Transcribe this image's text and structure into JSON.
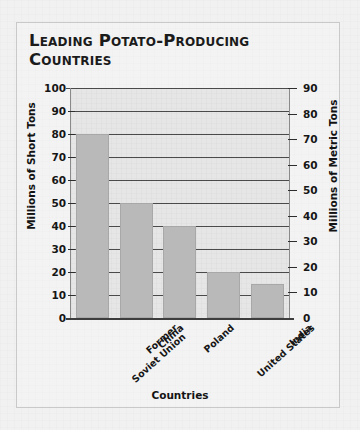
{
  "chart_data": {
    "type": "bar",
    "title": "Leading Potato-Producing\nCountries",
    "categories": [
      "Former\nSoviet Union",
      "China",
      "Poland",
      "United States",
      "India"
    ],
    "values": [
      80,
      50,
      40,
      20,
      15
    ],
    "xlabel": "Countries",
    "ylabel": "Millions of Short Tons",
    "ylabel_secondary": "Millions of Metric Tons",
    "ylim": [
      0,
      100
    ],
    "ylim_secondary": [
      0,
      90
    ],
    "yticks": [
      0,
      10,
      20,
      30,
      40,
      50,
      60,
      70,
      80,
      90,
      100
    ],
    "yticks_secondary": [
      0,
      10,
      20,
      30,
      40,
      50,
      60,
      70,
      80,
      90
    ],
    "grid": true,
    "legend": null,
    "bar_color": "#b9b9b9",
    "grid_color": "#4a4a4a",
    "plot_bg": "#e6e6e6"
  }
}
